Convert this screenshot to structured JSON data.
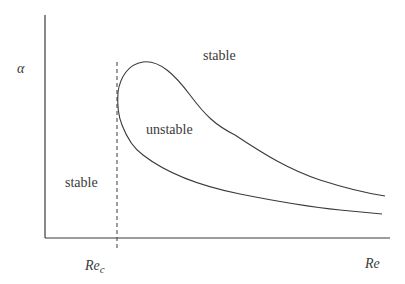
{
  "diagram": {
    "y_axis_label": "α",
    "x_axis_label": "Re",
    "critical_label": "Re",
    "critical_subscript": "c",
    "regions": {
      "stable_top": "stable",
      "stable_left": "stable",
      "unstable": "unstable"
    },
    "colors": {
      "line": "#3a3a3a",
      "background": "#ffffff"
    }
  }
}
